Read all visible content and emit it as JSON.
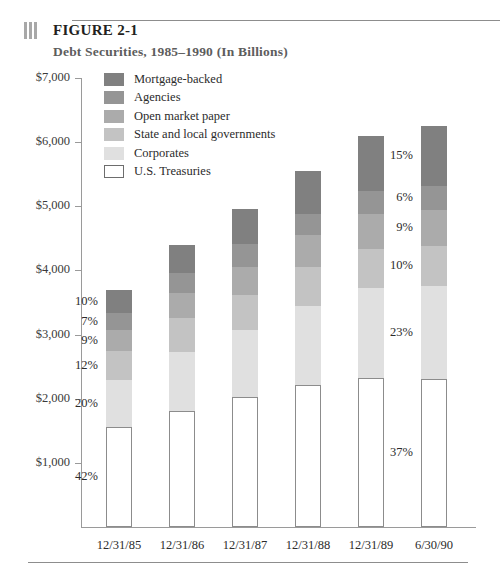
{
  "header": {
    "icon": "bars-icon",
    "figure_label": "FIGURE 2-1",
    "subtitle": "Debt Securities, 1985–1990 (In Billions)"
  },
  "chart_data": {
    "type": "bar",
    "subtype": "stacked-bar",
    "title": "Debt Securities, 1985–1990 (In Billions)",
    "xlabel": "",
    "ylabel": "",
    "ylim": [
      0,
      7000
    ],
    "yticks": [
      1000,
      2000,
      3000,
      4000,
      5000,
      6000,
      7000
    ],
    "ytick_labels": [
      "$1,000",
      "$2,000",
      "$3,000",
      "$4,000",
      "$5,000",
      "$6,000",
      "$7,000"
    ],
    "grid": false,
    "legend_position": "upper-left-inside",
    "categories": [
      "12/31/85",
      "12/31/86",
      "12/31/87",
      "12/31/88",
      "12/31/89",
      "6/30/90"
    ],
    "totals": [
      3700,
      4400,
      4950,
      5550,
      6100,
      6250
    ],
    "series": [
      {
        "name": "U.S. Treasuries",
        "color": "#ffffff",
        "border": "#8c8c8c",
        "percent": [
          42,
          41,
          41,
          40,
          38,
          37
        ],
        "values": [
          1554,
          1804,
          2030,
          2220,
          2318,
          2313
        ]
      },
      {
        "name": "Corporates",
        "color": "#e0e0e0",
        "percent": [
          20,
          21,
          21,
          22,
          23,
          23
        ],
        "values": [
          740,
          924,
          1040,
          1221,
          1403,
          1438
        ]
      },
      {
        "name": "State and local governments",
        "color": "#c3c3c3",
        "percent": [
          12,
          12,
          11,
          11,
          10,
          10
        ],
        "values": [
          444,
          528,
          545,
          611,
          610,
          625
        ]
      },
      {
        "name": "Open market paper",
        "color": "#ababab",
        "percent": [
          9,
          9,
          9,
          9,
          9,
          9
        ],
        "values": [
          333,
          396,
          446,
          500,
          549,
          563
        ]
      },
      {
        "name": "Agencies",
        "color": "#959595",
        "percent": [
          7,
          7,
          7,
          6,
          6,
          6
        ],
        "values": [
          259,
          308,
          347,
          333,
          366,
          375
        ]
      },
      {
        "name": "Mortgage-backed",
        "color": "#808080",
        "percent": [
          10,
          10,
          11,
          12,
          14,
          15
        ],
        "values": [
          370,
          440,
          545,
          666,
          854,
          938
        ]
      }
    ],
    "annotations": {
      "bar_1_labels": [
        "42%",
        "20%",
        "12%",
        "9%",
        "7%",
        "10%"
      ],
      "bar_6_labels": [
        "37%",
        "23%",
        "10%",
        "9%",
        "6%",
        "15%"
      ]
    }
  },
  "legend": {
    "items": [
      {
        "label": "Mortgage-backed",
        "color": "#808080"
      },
      {
        "label": "Agencies",
        "color": "#959595"
      },
      {
        "label": "Open market paper",
        "color": "#ababab"
      },
      {
        "label": "State and local governments",
        "color": "#c3c3c3"
      },
      {
        "label": "Corporates",
        "color": "#e0e0e0"
      },
      {
        "label": "U.S. Treasuries",
        "color": "#ffffff"
      }
    ]
  }
}
